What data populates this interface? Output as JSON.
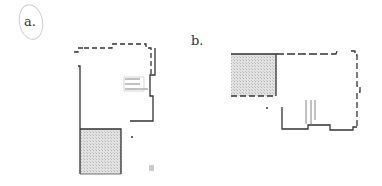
{
  "panels": [
    {
      "id": "a",
      "label": "a."
    },
    {
      "id": "b",
      "label": "b."
    }
  ],
  "colors": {
    "wall": "#333333",
    "hatch": "#d8d8d8",
    "background": "#ffffff"
  }
}
